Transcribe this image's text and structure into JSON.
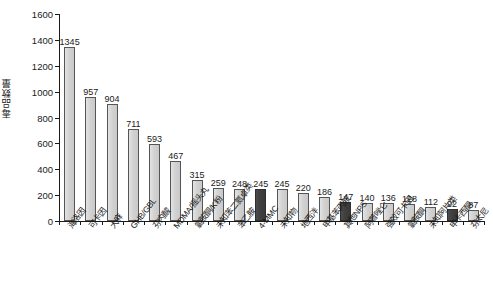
{
  "chart_data": {
    "type": "bar",
    "title": "",
    "xlabel": "",
    "ylabel": "毒品数量",
    "ylim": [
      0,
      1600
    ],
    "yticks": [
      0,
      200,
      400,
      600,
      800,
      1000,
      1200,
      1400,
      1600
    ],
    "grid": false,
    "legend": "none",
    "categories": [
      "海洛因",
      "可卡因",
      "大麻",
      "GHB/GBL",
      "芬内酸",
      "MDMA/摇头丸",
      "氯胺酮/K粉",
      "未知苯二氮卓类",
      "苯乙胺",
      "4-MMC",
      "未知物",
      "地西泮",
      "甲基苯丙胺",
      "其他NPS",
      "阿普唑仑",
      "强效可卡因",
      "氯胺酮",
      "未知阿片类",
      "甲卡西酮",
      "芬太尼"
    ],
    "values": [
      1345,
      957,
      904,
      711,
      593,
      467,
      315,
      259,
      248,
      245,
      245,
      220,
      186,
      147,
      140,
      136,
      128,
      112,
      92,
      87
    ],
    "highlighted": [
      false,
      false,
      false,
      false,
      false,
      false,
      false,
      false,
      false,
      true,
      false,
      false,
      false,
      true,
      false,
      false,
      false,
      false,
      true,
      false
    ],
    "colors": {
      "bar_light": "#d4d4d4",
      "bar_dark": "#3f3f3f",
      "bar_border": "#555555",
      "axis": "#1a1a1a",
      "text": "#1a1a1a",
      "background": "#ffffff"
    }
  }
}
